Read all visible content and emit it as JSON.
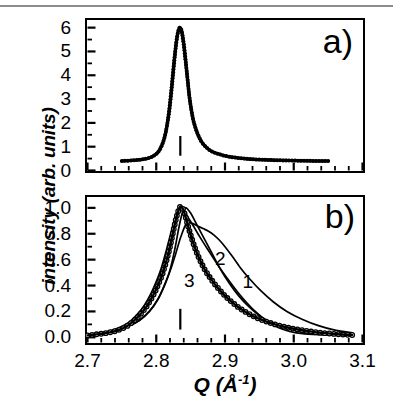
{
  "figure": {
    "axis": {
      "x_label_symbol": "Q",
      "x_label_unit": "(Å",
      "x_label_exponent": "-1",
      "x_label_close": ")",
      "y_label": "intensity (arb. units)"
    }
  },
  "panel_a": {
    "tag": "a)"
  },
  "panel_b": {
    "tag": "b)",
    "curve_labels": [
      "1",
      "2",
      "3"
    ]
  },
  "chart_data": [
    {
      "type": "line",
      "panel": "a",
      "title": "",
      "xlabel": "Q (Å-1)",
      "ylabel": "intensity (arb. units)",
      "xlim": [
        2.7,
        3.1
      ],
      "ylim": [
        0,
        6.3
      ],
      "xticks": [
        2.7,
        2.8,
        2.9,
        3.0,
        3.1
      ],
      "yticks": [
        0,
        1,
        2,
        3,
        4,
        5,
        6
      ],
      "ytick_labels": [
        "0",
        "1",
        "2",
        "3",
        "4",
        "5",
        "6"
      ],
      "xtick_labels_visible": false,
      "grid": false,
      "legend": "none",
      "marker": "filled-circle",
      "annotations": [
        {
          "type": "vertical-tick",
          "x": 2.835,
          "y0": 0.62,
          "y1": 1.45
        }
      ],
      "series": [
        {
          "name": "experimental",
          "style": "dense-filled-circles",
          "x": [
            2.75,
            2.756,
            2.762,
            2.768,
            2.774,
            2.78,
            2.786,
            2.792,
            2.798,
            2.802,
            2.806,
            2.81,
            2.813,
            2.816,
            2.819,
            2.822,
            2.824,
            2.826,
            2.828,
            2.83,
            2.832,
            2.834,
            2.836,
            2.838,
            2.84,
            2.842,
            2.844,
            2.846,
            2.848,
            2.851,
            2.854,
            2.857,
            2.86,
            2.864,
            2.868,
            2.873,
            2.878,
            2.884,
            2.89,
            2.898,
            2.906,
            2.916,
            2.928,
            2.942,
            2.958,
            2.976,
            2.995,
            3.015,
            3.035,
            3.05
          ],
          "y": [
            0.4,
            0.41,
            0.42,
            0.43,
            0.45,
            0.47,
            0.5,
            0.55,
            0.65,
            0.75,
            0.92,
            1.2,
            1.5,
            1.95,
            2.55,
            3.35,
            3.95,
            4.55,
            5.1,
            5.55,
            5.85,
            6.0,
            5.95,
            5.7,
            5.3,
            4.8,
            4.25,
            3.7,
            3.15,
            2.55,
            2.1,
            1.8,
            1.55,
            1.3,
            1.12,
            0.97,
            0.85,
            0.76,
            0.7,
            0.63,
            0.58,
            0.54,
            0.5,
            0.47,
            0.45,
            0.43,
            0.42,
            0.41,
            0.4,
            0.4
          ]
        }
      ]
    },
    {
      "type": "line",
      "panel": "b",
      "title": "",
      "xlabel": "Q (Å-1)",
      "ylabel": "intensity (arb. units)",
      "xlim": [
        2.7,
        3.1
      ],
      "ylim": [
        -0.04,
        1.08
      ],
      "xticks": [
        2.7,
        2.8,
        2.9,
        3.0,
        3.1
      ],
      "yticks": [
        0.0,
        0.2,
        0.4,
        0.6,
        0.8,
        1.0
      ],
      "ytick_labels": [
        "0.0",
        "0.2",
        "0.4",
        "0.6",
        "0.8",
        "1.0"
      ],
      "xtick_labels": [
        "2.7",
        "2.8",
        "2.9",
        "3.0",
        "3.1"
      ],
      "grid": false,
      "legend": "inline-curve-numbers",
      "marker": "open-circle",
      "annotations": [
        {
          "type": "vertical-tick",
          "x": 2.835,
          "y0": 0.06,
          "y1": 0.22
        },
        {
          "type": "curve-number",
          "label": "1",
          "x": 2.933,
          "y": 0.42
        },
        {
          "type": "curve-number",
          "label": "2",
          "x": 2.893,
          "y": 0.6
        },
        {
          "type": "curve-number",
          "label": "3",
          "x": 2.848,
          "y": 0.43
        }
      ],
      "series": [
        {
          "name": "data",
          "style": "open-circles",
          "x": [
            2.7,
            2.708,
            2.716,
            2.724,
            2.732,
            2.74,
            2.748,
            2.756,
            2.763,
            2.77,
            2.776,
            2.782,
            2.788,
            2.793,
            2.798,
            2.803,
            2.808,
            2.812,
            2.816,
            2.82,
            2.823,
            2.826,
            2.829,
            2.832,
            2.835,
            2.838,
            2.841,
            2.844,
            2.847,
            2.851,
            2.855,
            2.86,
            2.866,
            2.872,
            2.879,
            2.886,
            2.894,
            2.902,
            2.911,
            2.92,
            2.93,
            2.94,
            2.951,
            2.962,
            2.974,
            2.986,
            2.998,
            3.012,
            3.026,
            3.04,
            3.055,
            3.07,
            3.085
          ],
          "y": [
            0.015,
            0.02,
            0.025,
            0.03,
            0.038,
            0.048,
            0.062,
            0.082,
            0.108,
            0.14,
            0.172,
            0.21,
            0.255,
            0.3,
            0.35,
            0.41,
            0.475,
            0.54,
            0.615,
            0.7,
            0.775,
            0.85,
            0.92,
            0.975,
            1.01,
            1.0,
            0.96,
            0.905,
            0.845,
            0.775,
            0.71,
            0.64,
            0.57,
            0.51,
            0.455,
            0.405,
            0.355,
            0.31,
            0.268,
            0.23,
            0.196,
            0.166,
            0.14,
            0.118,
            0.098,
            0.082,
            0.068,
            0.055,
            0.044,
            0.035,
            0.028,
            0.022,
            0.018
          ]
        },
        {
          "name": "fit 1",
          "style": "thin-line",
          "x": [
            2.7,
            2.72,
            2.74,
            2.76,
            2.775,
            2.79,
            2.802,
            2.812,
            2.82,
            2.828,
            2.836,
            2.844,
            2.852,
            2.86,
            2.868,
            2.876,
            2.884,
            2.892,
            2.9,
            2.91,
            2.922,
            2.936,
            2.952,
            2.97,
            2.99,
            3.012,
            3.036,
            3.06,
            3.085
          ],
          "y": [
            0.02,
            0.032,
            0.052,
            0.09,
            0.13,
            0.2,
            0.29,
            0.4,
            0.51,
            0.64,
            0.78,
            0.88,
            0.88,
            0.86,
            0.84,
            0.82,
            0.79,
            0.75,
            0.7,
            0.63,
            0.54,
            0.45,
            0.36,
            0.275,
            0.2,
            0.14,
            0.09,
            0.055,
            0.035
          ]
        },
        {
          "name": "fit 2",
          "style": "thin-line",
          "x": [
            2.7,
            2.72,
            2.74,
            2.76,
            2.776,
            2.79,
            2.802,
            2.812,
            2.82,
            2.827,
            2.833,
            2.838,
            2.843,
            2.85,
            2.858,
            2.868,
            2.88,
            2.893,
            2.906,
            2.92,
            2.934,
            2.948,
            2.962,
            2.978,
            2.995,
            3.015,
            3.038,
            3.062,
            3.085
          ],
          "y": [
            0.018,
            0.03,
            0.05,
            0.086,
            0.132,
            0.2,
            0.29,
            0.405,
            0.52,
            0.68,
            0.85,
            0.96,
            1.0,
            0.96,
            0.88,
            0.78,
            0.66,
            0.53,
            0.42,
            0.32,
            0.24,
            0.175,
            0.128,
            0.09,
            0.062,
            0.04,
            0.026,
            0.018,
            0.014
          ]
        },
        {
          "name": "fit 3",
          "style": "thin-line",
          "x": [
            2.7,
            2.722,
            2.742,
            2.76,
            2.772,
            2.783,
            2.792,
            2.8,
            2.807,
            2.813,
            2.818,
            2.823,
            2.827,
            2.831,
            2.835,
            2.84,
            2.846,
            2.854,
            2.864,
            2.876,
            2.89,
            2.904,
            2.918,
            2.932,
            2.946,
            2.96,
            2.976,
            2.994,
            3.016,
            3.044,
            3.085
          ],
          "y": [
            0.02,
            0.036,
            0.065,
            0.115,
            0.175,
            0.25,
            0.335,
            0.43,
            0.53,
            0.64,
            0.74,
            0.84,
            0.92,
            0.98,
            1.01,
            0.985,
            0.93,
            0.86,
            0.77,
            0.67,
            0.555,
            0.45,
            0.352,
            0.265,
            0.19,
            0.13,
            0.08,
            0.045,
            0.026,
            0.018,
            0.015
          ]
        }
      ]
    }
  ]
}
